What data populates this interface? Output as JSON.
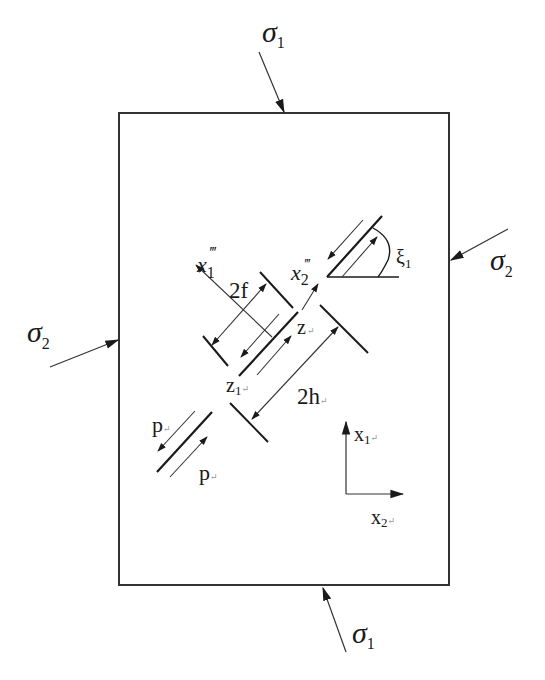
{
  "diagram": {
    "type": "crack-interaction-schematic",
    "colors": {
      "line": "#1a1a1a",
      "thin_line": "#333333",
      "background": "#ffffff"
    },
    "stress_labels": {
      "sigma1_top": {
        "symbol": "σ",
        "sub": "1"
      },
      "sigma1_bottom": {
        "symbol": "σ",
        "sub": "1"
      },
      "sigma2_left": {
        "symbol": "σ",
        "sub": "2"
      },
      "sigma2_right": {
        "symbol": "σ",
        "sub": "2"
      }
    },
    "labels": {
      "x1_local": {
        "base": "x",
        "sub": "1",
        "sup": "‴"
      },
      "x2_local": {
        "base": "x",
        "sub": "2",
        "sup": "‴"
      },
      "half_length": "2f",
      "spacing": "2h",
      "z": "z",
      "z1": "z",
      "z1_sub": "1",
      "angle": "ξ",
      "angle_sub": "1",
      "p_upper": "p",
      "p_lower": "p",
      "axis_x1": "x",
      "axis_x1_sub": "1",
      "axis_x2": "x",
      "axis_x2_sub": "2",
      "return_mark": "↵"
    }
  }
}
